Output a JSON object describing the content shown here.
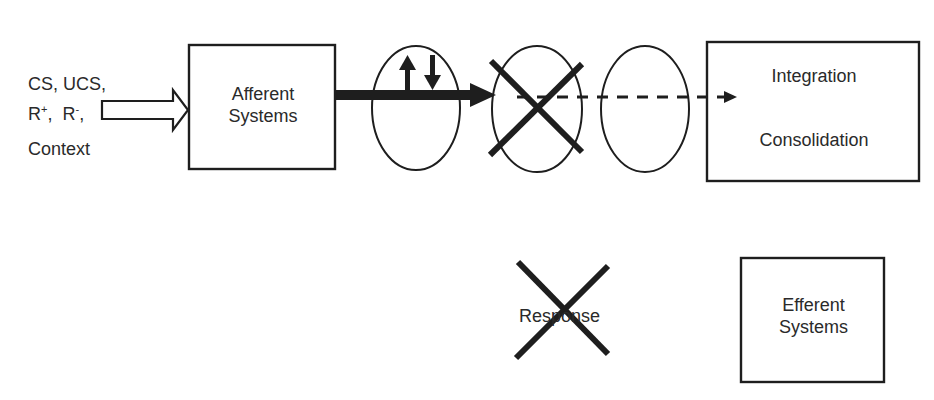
{
  "inputs": {
    "line1": "CS, UCS,",
    "line2_r": "R",
    "line2_plus": "+",
    "line2_sep": ",  R",
    "line2_minus": "-",
    "line2_end": ",",
    "line3": "Context"
  },
  "afferent_box": {
    "line1": "Afferent",
    "line2": "Systems"
  },
  "integration_box": {
    "line1": "Integration",
    "line2": "Consolidation"
  },
  "response": {
    "label": "Response",
    "crossed_out": true
  },
  "efferent_box": {
    "line1": "Efferent",
    "line2": "Systems"
  },
  "colors": {
    "stroke": "#1e1e1e",
    "text": "#2a2a2a",
    "background": "#ffffff"
  }
}
